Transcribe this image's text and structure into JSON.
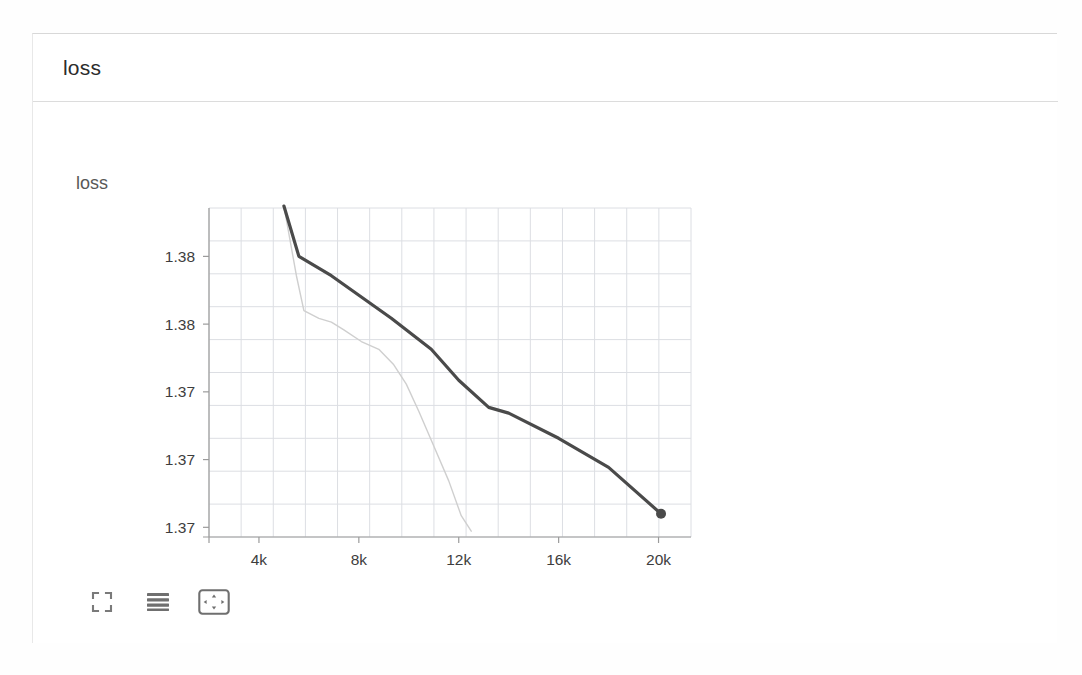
{
  "header": {
    "title": "loss"
  },
  "chart_panel": {
    "title": "loss",
    "toolbar": {
      "items": [
        {
          "name": "fullscreen-icon",
          "label": "Fullscreen"
        },
        {
          "name": "lines-icon",
          "label": "Toggle data table"
        },
        {
          "name": "fit-domain-icon",
          "label": "Fit domain to data"
        }
      ]
    }
  },
  "chart_data": {
    "type": "line",
    "title": "loss",
    "xlabel": "",
    "ylabel": "",
    "grid": true,
    "legend": null,
    "xlim": [
      2000,
      21300
    ],
    "ylim": [
      1.3665,
      1.3835
    ],
    "xticks": [
      4000,
      8000,
      12000,
      16000,
      20000
    ],
    "xticklabels": [
      "4k",
      "8k",
      "12k",
      "16k",
      "20k"
    ],
    "yticks": [
      1.381,
      1.3775,
      1.374,
      1.3705,
      1.367
    ],
    "yticklabels": [
      "1.38",
      "1.38",
      "1.37",
      "1.37",
      "1.37"
    ],
    "series": [
      {
        "name": "loss (smoothed)",
        "color": "#4a4a4a",
        "width": 3.2,
        "opacity": 1,
        "marker": {
          "shape": "circle",
          "at_last_point": true,
          "size": 5
        },
        "x": [
          5000,
          5600,
          6900,
          9300,
          10900,
          12000,
          13200,
          14000,
          16000,
          18000,
          20100
        ],
        "y": [
          1.3836,
          1.381,
          1.38,
          1.3778,
          1.3762,
          1.3746,
          1.3732,
          1.3729,
          1.3716,
          1.3701,
          1.3677
        ]
      },
      {
        "name": "loss (raw)",
        "color": "#cfcfcf",
        "width": 1.4,
        "opacity": 1,
        "marker": null,
        "x": [
          5000,
          5500,
          5800,
          6400,
          6900,
          7400,
          8100,
          8800,
          9400,
          9900,
          10400,
          11000,
          11600,
          12100,
          12500
        ],
        "y": [
          1.3836,
          1.38,
          1.3782,
          1.3778,
          1.3776,
          1.3772,
          1.3766,
          1.3762,
          1.3754,
          1.3744,
          1.373,
          1.3712,
          1.3694,
          1.3676,
          1.3668
        ]
      }
    ]
  }
}
